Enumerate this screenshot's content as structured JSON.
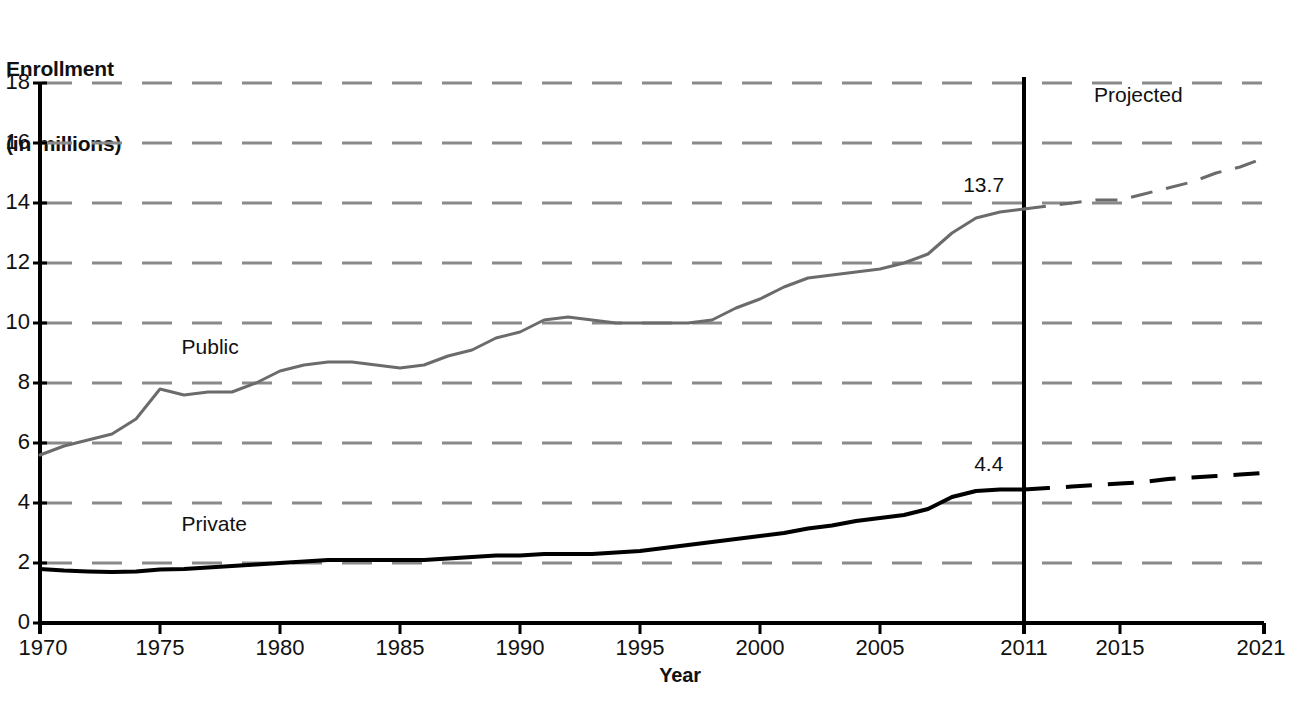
{
  "chart_data": {
    "type": "line",
    "title": "",
    "ylabel": "Enrollment\n(in millions)",
    "ylabel_line1": "Enrollment",
    "ylabel_line2": "(in millions)",
    "xlabel": "Year",
    "ylim": [
      0,
      18
    ],
    "xlim": [
      1970,
      2021
    ],
    "ytick_labels": [
      "0",
      "2",
      "4",
      "6",
      "8",
      "10",
      "12",
      "14",
      "16",
      "18"
    ],
    "ytick_values": [
      0,
      2,
      4,
      6,
      8,
      10,
      12,
      14,
      16,
      18
    ],
    "xtick_labels": [
      "1970",
      "1975",
      "1980",
      "1985",
      "1990",
      "1995",
      "2000",
      "2005",
      "2011",
      "2015",
      "2021"
    ],
    "xtick_values": [
      1970,
      1975,
      1980,
      1985,
      1990,
      1995,
      2000,
      2005,
      2011,
      2015,
      2021
    ],
    "grid": true,
    "grid_style": "dashed",
    "grid_color": "#8a8a8a",
    "legend": "inline-labels",
    "annotations": [
      {
        "text": "Projected",
        "x": 2016,
        "y": 17.6
      },
      {
        "text": "13.7",
        "x": 2009.3,
        "y": 14.6
      },
      {
        "text": "4.4",
        "x": 2009.3,
        "y": 5.3
      }
    ],
    "divider": {
      "x": 2011,
      "label": "projection-divider",
      "color": "#000000"
    },
    "series": [
      {
        "name": "Public",
        "color": "#6b6b6b",
        "line_width": 3,
        "actual": {
          "x": [
            1970,
            1971,
            1972,
            1973,
            1974,
            1975,
            1976,
            1977,
            1978,
            1979,
            1980,
            1981,
            1982,
            1983,
            1984,
            1985,
            1986,
            1987,
            1988,
            1989,
            1990,
            1991,
            1992,
            1993,
            1994,
            1995,
            1996,
            1997,
            1998,
            1999,
            2000,
            2001,
            2002,
            2003,
            2004,
            2005,
            2006,
            2007,
            2008,
            2009,
            2010,
            2011
          ],
          "y": [
            5.6,
            5.9,
            6.1,
            6.3,
            6.8,
            7.8,
            7.6,
            7.7,
            7.7,
            8.0,
            8.4,
            8.6,
            8.7,
            8.7,
            8.6,
            8.5,
            8.6,
            8.9,
            9.1,
            9.5,
            9.7,
            10.1,
            10.2,
            10.1,
            10.0,
            10.0,
            10.0,
            10.0,
            10.1,
            10.5,
            10.8,
            11.2,
            11.5,
            11.6,
            11.7,
            11.8,
            12.0,
            12.3,
            13.0,
            13.5,
            13.7,
            13.8
          ]
        },
        "projected": {
          "x": [
            2011,
            2012,
            2013,
            2014,
            2015,
            2016,
            2017,
            2018,
            2019,
            2020,
            2021
          ],
          "y": [
            13.8,
            13.9,
            14.0,
            14.1,
            14.1,
            14.3,
            14.5,
            14.7,
            15.0,
            15.2,
            15.5
          ]
        },
        "projected_style": "dashed",
        "label_position": {
          "x": 1975.9,
          "y": 9.2
        }
      },
      {
        "name": "Private",
        "color": "#000000",
        "line_width": 4,
        "actual": {
          "x": [
            1970,
            1971,
            1972,
            1973,
            1974,
            1975,
            1976,
            1977,
            1978,
            1979,
            1980,
            1981,
            1982,
            1983,
            1984,
            1985,
            1986,
            1987,
            1988,
            1989,
            1990,
            1991,
            1992,
            1993,
            1994,
            1995,
            1996,
            1997,
            1998,
            1999,
            2000,
            2001,
            2002,
            2003,
            2004,
            2005,
            2006,
            2007,
            2008,
            2009,
            2010,
            2011
          ],
          "y": [
            1.8,
            1.75,
            1.72,
            1.7,
            1.72,
            1.78,
            1.8,
            1.85,
            1.9,
            1.95,
            2.0,
            2.05,
            2.1,
            2.1,
            2.1,
            2.1,
            2.1,
            2.15,
            2.2,
            2.25,
            2.25,
            2.3,
            2.3,
            2.3,
            2.35,
            2.4,
            2.5,
            2.6,
            2.7,
            2.8,
            2.9,
            3.0,
            3.15,
            3.25,
            3.4,
            3.5,
            3.6,
            3.8,
            4.2,
            4.4,
            4.45,
            4.45
          ]
        },
        "projected": {
          "x": [
            2011,
            2012,
            2013,
            2014,
            2015,
            2016,
            2017,
            2018,
            2019,
            2020,
            2021
          ],
          "y": [
            4.45,
            4.5,
            4.55,
            4.6,
            4.65,
            4.7,
            4.8,
            4.85,
            4.9,
            4.95,
            5.0
          ]
        },
        "projected_style": "dashed",
        "label_position": {
          "x": 1975.9,
          "y": 3.3
        }
      }
    ]
  },
  "labels": {
    "y_axis_line1": "Enrollment",
    "y_axis_line2": "(in millions)",
    "x_axis": "Year",
    "projected": "Projected",
    "public": "Public",
    "private": "Private",
    "public_value": "13.7",
    "private_value": "4.4"
  },
  "y_ticks": [
    {
      "label": "18"
    },
    {
      "label": "16"
    },
    {
      "label": "14"
    },
    {
      "label": "12"
    },
    {
      "label": "10"
    },
    {
      "label": "8"
    },
    {
      "label": "6"
    },
    {
      "label": "4"
    },
    {
      "label": "2"
    },
    {
      "label": "0"
    }
  ],
  "x_ticks": [
    {
      "label": "1970"
    },
    {
      "label": "1975"
    },
    {
      "label": "1980"
    },
    {
      "label": "1985"
    },
    {
      "label": "1990"
    },
    {
      "label": "1995"
    },
    {
      "label": "2000"
    },
    {
      "label": "2005"
    },
    {
      "label": "2011"
    },
    {
      "label": "2015"
    },
    {
      "label": "2021"
    }
  ]
}
